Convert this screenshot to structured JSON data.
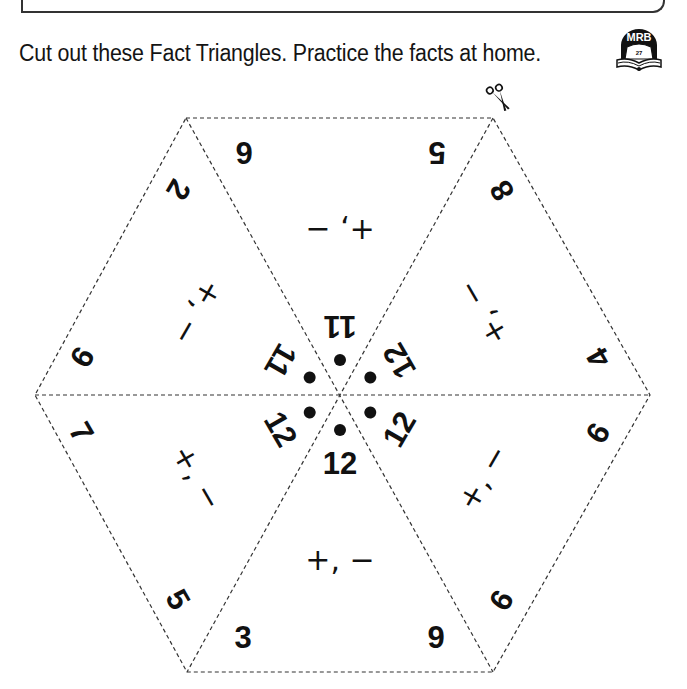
{
  "header": {
    "instruction": "Cut out these Fact Triangles. Practice the facts at home.",
    "mrb_badge": {
      "label": "MRB",
      "page": "27",
      "icon": "book-icon"
    }
  },
  "cut_icon": "scissors-icon",
  "colors": {
    "ink": "#111111",
    "dash": "#333333",
    "background": "#ffffff"
  },
  "fact_triangles": [
    {
      "position": "bottom",
      "rotation_deg": 0,
      "sum": "12",
      "facts": [
        "3",
        "9"
      ],
      "operations": "+, −"
    },
    {
      "position": "lower-left",
      "rotation_deg": 60,
      "sum": "12",
      "facts": [
        "7",
        "5"
      ],
      "operations": "+, −"
    },
    {
      "position": "upper-left",
      "rotation_deg": 120,
      "sum": "11",
      "facts": [
        "2",
        "9"
      ],
      "operations": "+, −"
    },
    {
      "position": "top",
      "rotation_deg": 180,
      "sum": "11",
      "facts": [
        "5",
        "6"
      ],
      "operations": "+, −"
    },
    {
      "position": "upper-right",
      "rotation_deg": 240,
      "sum": "12",
      "facts": [
        "4",
        "8"
      ],
      "operations": "+, −"
    },
    {
      "position": "lower-right",
      "rotation_deg": 300,
      "sum": "12",
      "facts": [
        "6",
        "6"
      ],
      "operations": "+, −"
    }
  ]
}
